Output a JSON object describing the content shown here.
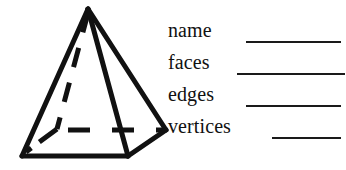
{
  "page": {
    "width": 346,
    "height": 170,
    "background_color": "#ffffff",
    "ink_color": "#111111"
  },
  "figure": {
    "name": "square-pyramid",
    "stroke_color": "#111111",
    "fill_color": "#ffffff",
    "vertices": {
      "apex": [
        88,
        9
      ],
      "front_left_base": [
        22,
        156
      ],
      "front_right_base": [
        128,
        156
      ],
      "right_back_base": [
        166,
        130
      ],
      "hidden_back_base": [
        57,
        129
      ]
    },
    "solid_edges": [
      "apex-front_left_base",
      "apex-front_right_base",
      "apex-right_back_base",
      "front_left_base-front_right_base",
      "front_right_base-right_back_base"
    ],
    "hidden_dashed_edges": [
      "apex-hidden_back_base",
      "hidden_back_base-front_left_base",
      "hidden_back_base-right_back_base"
    ]
  },
  "worksheet": {
    "rows": [
      {
        "label": "name",
        "blank_start": 246,
        "blank_end": 341,
        "blank_y": 41
      },
      {
        "label": "faces",
        "blank_start": 237,
        "blank_end": 345,
        "blank_y": 73
      },
      {
        "label": "edges",
        "blank_start": 246,
        "blank_end": 341,
        "blank_y": 105
      },
      {
        "label": "vertices",
        "blank_start": 272,
        "blank_end": 341,
        "blank_y": 137
      }
    ]
  }
}
